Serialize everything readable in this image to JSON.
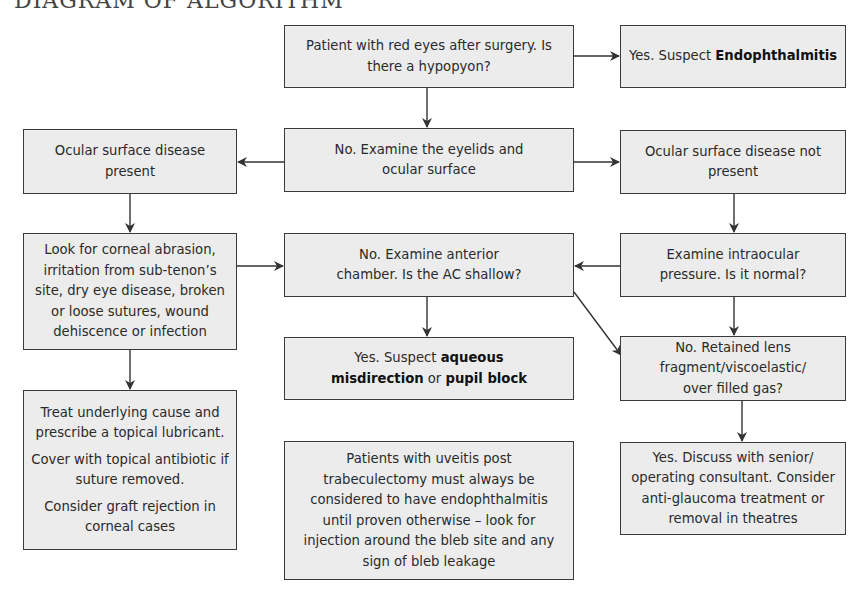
{
  "title": "DIAGRAM OF ALGORITHM",
  "nodes": {
    "start": {
      "text": "Patient with red eyes after surgery. Is there a hypopyon?"
    },
    "endophthalmitis": {
      "prefix": "Yes. Suspect ",
      "bold": "Endophthalmitis"
    },
    "examine_eyelids": {
      "text": "No. Examine the eyelids and ocular surface"
    },
    "osd_present": {
      "text": "Ocular surface disease present"
    },
    "osd_not_present": {
      "text": "Ocular surface disease not present"
    },
    "look_for": {
      "text": "Look for corneal abrasion, irritation from sub-tenon’s site, dry eye disease, broken or loose sutures, wound dehiscence or infection"
    },
    "examine_ac": {
      "text": "No. Examine anterior chamber. Is the AC shallow?"
    },
    "examine_iop": {
      "text": "Examine intraocular pressure. Is it normal?"
    },
    "aqueous": {
      "prefix": "Yes. Suspect ",
      "bold1": "aqueous misdirection",
      "middle": " or ",
      "bold2": "pupil block"
    },
    "retained_lens": {
      "text": "No. Retained lens fragment/viscoelastic/ over filled gas?"
    },
    "treat": {
      "p1": "Treat underlying cause and prescribe a topical lubricant.",
      "p2": "Cover with topical antibiotic if suture removed.",
      "p3": "Consider graft rejection in corneal cases"
    },
    "uveitis_note": {
      "text": "Patients with uveitis post trabeculectomy must always be considered to have endophthalmitis until proven otherwise – look for injection around the bleb site and any sign of bleb leakage"
    },
    "discuss": {
      "text": "Yes. Discuss with senior/ operating consultant. Consider anti-glaucoma treatment or removal in theatres"
    }
  },
  "colors": {
    "box_fill": "#ececec",
    "border": "#3a3a3a",
    "arrow": "#333333"
  }
}
